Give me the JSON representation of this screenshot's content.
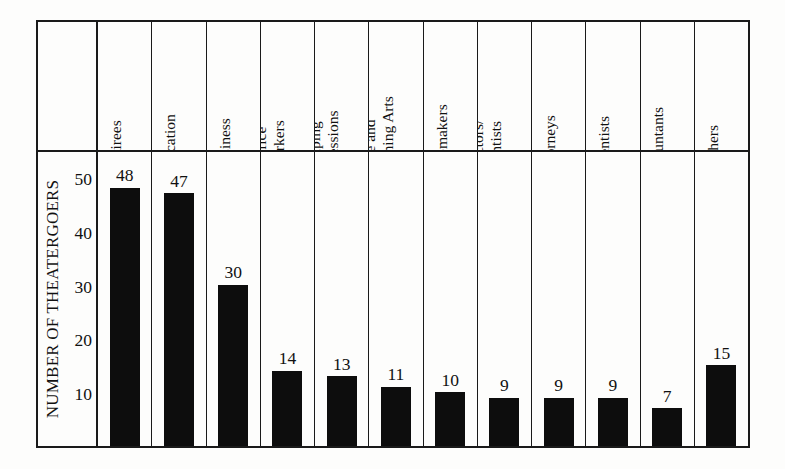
{
  "chart_data": {
    "type": "bar",
    "title": "",
    "subtitle": "",
    "xlabel": "",
    "ylabel": "NUMBER OF THEATERGOERS",
    "ylim": [
      0,
      55
    ],
    "yticks": [
      10,
      20,
      30,
      40,
      50
    ],
    "ytick_labels": [
      "10",
      "20",
      "30",
      "40",
      "50"
    ],
    "grid": false,
    "legend": "none",
    "bar_color": "#0d0d0d",
    "frame_color": "#1a1a1a",
    "background_color": "#fdfdfc",
    "value_labels_shown": true,
    "categories": [
      "Retirees",
      "Education",
      "Business",
      "Office Workers",
      "Helping Professions",
      "Fine and Performing Arts",
      "Homemakers",
      "Doctors/ Dentists",
      "Attorneys",
      "Scientists",
      "Accountants",
      "Others"
    ],
    "category_lines": [
      [
        "Retirees"
      ],
      [
        "Education"
      ],
      [
        "Business"
      ],
      [
        "Office",
        "Workers"
      ],
      [
        "Helping",
        "Professions"
      ],
      [
        "Fine and",
        "Performing Arts"
      ],
      [
        "Homemakers"
      ],
      [
        "Doctors/",
        "Dentists"
      ],
      [
        "Attorneys"
      ],
      [
        "Scientists"
      ],
      [
        "Accountants"
      ],
      [
        "Others"
      ]
    ],
    "values": [
      48,
      47,
      30,
      14,
      13,
      11,
      10,
      9,
      9,
      9,
      7,
      15
    ],
    "value_label_text": [
      "48",
      "47",
      "30",
      "14",
      "13",
      "11",
      "10",
      "9",
      "9",
      "9",
      "7",
      "15"
    ]
  }
}
